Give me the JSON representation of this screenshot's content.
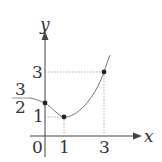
{
  "diagram": {
    "type": "function-graph",
    "axes": {
      "x_label": "x",
      "y_label": "y",
      "origin_label": "0"
    },
    "x_ticks": [
      "1",
      "3"
    ],
    "y_ticks": [
      "1",
      "3"
    ],
    "y_fraction_tick": {
      "numerator": "3",
      "denominator": "2"
    },
    "curve": "parabola",
    "points": [
      {
        "x": 0,
        "y": 1.5,
        "label": "(0, 3/2)"
      },
      {
        "x": 1,
        "y": 1,
        "label": "(1, 1)"
      },
      {
        "x": 3,
        "y": 3,
        "label": "(3, 3)"
      }
    ],
    "colors": {
      "axis": "#444444",
      "curve": "#777777",
      "guide": "#999999",
      "point": "#222222"
    }
  }
}
